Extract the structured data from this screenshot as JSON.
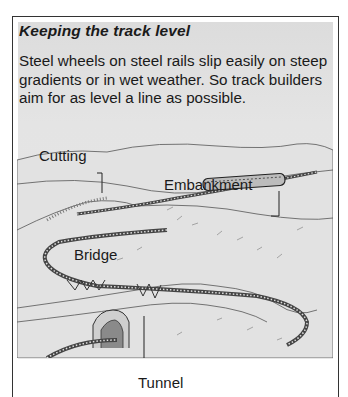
{
  "box": {
    "title": "Keeping the track level",
    "body": "Steel wheels on steel rails slip easily on steep gradients or in wet weather. So track builders aim for as level a line as possible."
  },
  "illustration": {
    "labels": {
      "cutting": "Cutting",
      "embankment": "Embankment",
      "bridge": "Bridge",
      "tunnel": "Tunnel"
    }
  }
}
